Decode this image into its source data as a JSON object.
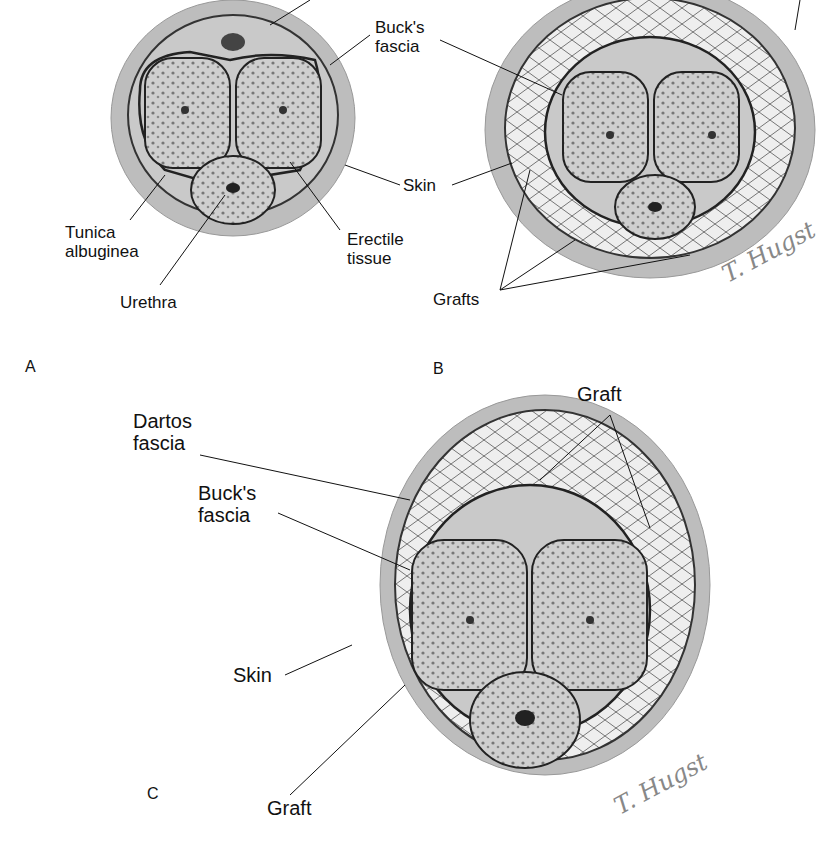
{
  "figure": {
    "panels": [
      {
        "id": "A",
        "label": "A",
        "labels": [
          "Buck's fascia",
          "Skin",
          "Tunica albuginea",
          "Erectile tissue",
          "Urethra"
        ]
      },
      {
        "id": "B",
        "label": "B",
        "labels": [
          "Grafts"
        ]
      },
      {
        "id": "C",
        "label": "C",
        "labels": [
          "Dartos fascia",
          "Graft",
          "Buck's fascia",
          "Skin",
          "Graft"
        ]
      }
    ],
    "labels": {
      "a_bucks_1": "Buck's",
      "a_bucks_2": "fascia",
      "a_skin": "Skin",
      "a_tunica_1": "Tunica",
      "a_tunica_2": "albuginea",
      "a_erectile_1": "Erectile",
      "a_erectile_2": "tissue",
      "a_urethra": "Urethra",
      "b_grafts": "Grafts",
      "c_dartos_1": "Dartos",
      "c_dartos_2": "fascia",
      "c_graft_top": "Graft",
      "c_bucks_1": "Buck's",
      "c_bucks_2": "fascia",
      "c_skin": "Skin",
      "c_graft_bottom": "Graft"
    },
    "panel_letters": {
      "a": "A",
      "b": "B",
      "c": "C"
    },
    "signature": "T. Hugst",
    "colors": {
      "skin": "#b9b9b9",
      "tissue": "#d4d4d4",
      "outline": "#222222",
      "graft": "#ececec"
    }
  }
}
